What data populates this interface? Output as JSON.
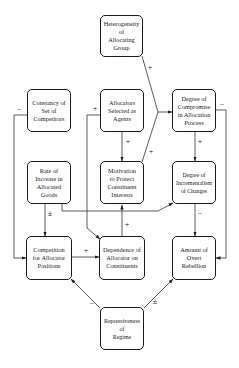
{
  "diagram": {
    "type": "causal-influence-diagram",
    "nodes": {
      "heterogeneity": {
        "label": "Heterogeneity\nof\nAllocating\nGroup"
      },
      "constancy": {
        "label": "Constancy of\nSet of\nCompetitors"
      },
      "allocators": {
        "label": "Allocators\nSelected as\nAgents"
      },
      "compromise": {
        "label": "Degree of\nCompromise\nin Allocation\nProcess"
      },
      "rate": {
        "label": "Rate of\nIncrease in\nAllocated\nGoods"
      },
      "motivation": {
        "label": "Motivation\nto Protect\nConstituent\nInterests"
      },
      "incrementalism": {
        "label": "Degree of\nIncrementalism\nof Changes"
      },
      "competition": {
        "label": "Competition\nfor Allocator\nPositions"
      },
      "dependence": {
        "label": "Dependence of\nAllocator on\nConstituents"
      },
      "rebellion": {
        "label": "Amount of\nOvert\nRebellion"
      },
      "repressiveness": {
        "label": "Repressiveness\nof\nRegime"
      }
    },
    "edges": [
      {
        "from": "heterogeneity",
        "to": "compromise",
        "sign": "+"
      },
      {
        "from": "motivation",
        "to": "compromise",
        "sign": "+"
      },
      {
        "from": "constancy",
        "to": "competition",
        "sign": "−"
      },
      {
        "from": "allocators",
        "to": "dependence",
        "sign": "+"
      },
      {
        "from": "allocators",
        "to": "motivation",
        "sign": "+"
      },
      {
        "from": "compromise",
        "to": "incrementalism",
        "sign": "+"
      },
      {
        "from": "compromise",
        "to": "rebellion",
        "sign": "−"
      },
      {
        "from": "rate",
        "to": "competition",
        "sign": "±"
      },
      {
        "from": "rate",
        "to": "incrementalism",
        "sign": "+"
      },
      {
        "from": "incrementalism",
        "to": "rebellion",
        "sign": "−"
      },
      {
        "from": "competition",
        "to": "dependence",
        "sign": "+"
      },
      {
        "from": "dependence",
        "to": "motivation",
        "sign": "+"
      },
      {
        "from": "repressiveness",
        "to": "competition",
        "sign": "−"
      },
      {
        "from": "repressiveness",
        "to": "rebellion",
        "sign": "±"
      }
    ],
    "signs": {
      "plus": "+",
      "minus": "−",
      "plus_minus": "±"
    }
  }
}
